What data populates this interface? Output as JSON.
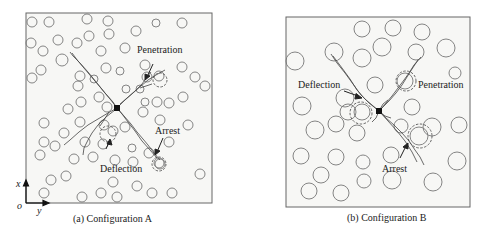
{
  "panels": [
    {
      "id": "a",
      "caption": "(a) Configuration A",
      "frame": {
        "x": 26,
        "y": 13,
        "w": 186,
        "h": 190
      },
      "annotations": {
        "penetration": "Penetration",
        "deflection": "Deflection",
        "arrest": "Arrest"
      },
      "axes": {
        "origin": "o",
        "x": "x",
        "y": "y"
      },
      "circles": [
        [
          32,
          22,
          5
        ],
        [
          49,
          22,
          5
        ],
        [
          87,
          19,
          5
        ],
        [
          108,
          21,
          5
        ],
        [
          156,
          23,
          4
        ],
        [
          182,
          23,
          5
        ],
        [
          31,
          43,
          5
        ],
        [
          43,
          51,
          5
        ],
        [
          58,
          40,
          5
        ],
        [
          77,
          43,
          5
        ],
        [
          89,
          36,
          5
        ],
        [
          109,
          34,
          5
        ],
        [
          136,
          31,
          5
        ],
        [
          125,
          48,
          5
        ],
        [
          101,
          51,
          5
        ],
        [
          62,
          60,
          6
        ],
        [
          41,
          70,
          5
        ],
        [
          32,
          78,
          5
        ],
        [
          106,
          68,
          5
        ],
        [
          80,
          76,
          5
        ],
        [
          145,
          65,
          5
        ],
        [
          159,
          76,
          5
        ],
        [
          182,
          67,
          5
        ],
        [
          195,
          77,
          5
        ],
        [
          205,
          86,
          5
        ],
        [
          120,
          71,
          4
        ],
        [
          140,
          89,
          4
        ],
        [
          157,
          102,
          5
        ],
        [
          147,
          77,
          5
        ],
        [
          94,
          79,
          4
        ],
        [
          126,
          89,
          4
        ],
        [
          99,
          97,
          5
        ],
        [
          78,
          86,
          5
        ],
        [
          68,
          109,
          5
        ],
        [
          81,
          102,
          5
        ],
        [
          107,
          107,
          5
        ],
        [
          145,
          102,
          4
        ],
        [
          143,
          112,
          5
        ],
        [
          169,
          103,
          5
        ],
        [
          183,
          97,
          5
        ],
        [
          160,
          120,
          5
        ],
        [
          188,
          125,
          5
        ],
        [
          44,
          123,
          5
        ],
        [
          80,
          122,
          5
        ],
        [
          104,
          125,
          5
        ],
        [
          125,
          127,
          5
        ],
        [
          64,
          133,
          5
        ],
        [
          44,
          142,
          5
        ],
        [
          55,
          146,
          5
        ],
        [
          85,
          142,
          5
        ],
        [
          103,
          144,
          5
        ],
        [
          113,
          131,
          5
        ],
        [
          132,
          148,
          4
        ],
        [
          149,
          153,
          5
        ],
        [
          169,
          142,
          5
        ],
        [
          40,
          155,
          5
        ],
        [
          74,
          159,
          5
        ],
        [
          93,
          157,
          5
        ],
        [
          115,
          160,
          5
        ],
        [
          133,
          162,
          5
        ],
        [
          160,
          164,
          5
        ],
        [
          159,
          163,
          5
        ],
        [
          51,
          180,
          5
        ],
        [
          66,
          176,
          5
        ],
        [
          113,
          182,
          5
        ],
        [
          137,
          186,
          5
        ],
        [
          200,
          174,
          5
        ],
        [
          44,
          193,
          5
        ],
        [
          82,
          197,
          5
        ],
        [
          101,
          193,
          5
        ],
        [
          117,
          197,
          5
        ],
        [
          152,
          193,
          5
        ],
        [
          172,
          193,
          5
        ]
      ],
      "dashed_circles": [
        [
          160,
          80,
          7
        ],
        [
          108,
          134,
          8
        ],
        [
          159,
          164,
          7
        ]
      ],
      "tip": [
        117,
        108
      ]
    },
    {
      "id": "b",
      "caption": "(b) Configuration B",
      "frame": {
        "x": 286,
        "y": 17,
        "w": 184,
        "h": 190
      },
      "annotations": {
        "penetration": "Penetration",
        "deflection": "Deflection",
        "arrest": "Arrest"
      },
      "circles": [
        [
          362,
          29,
          8
        ],
        [
          393,
          28,
          8
        ],
        [
          422,
          32,
          8
        ],
        [
          295,
          61,
          9
        ],
        [
          334,
          52,
          9
        ],
        [
          362,
          58,
          9
        ],
        [
          382,
          47,
          9
        ],
        [
          416,
          52,
          8
        ],
        [
          446,
          48,
          9
        ],
        [
          455,
          73,
          6
        ],
        [
          375,
          85,
          8
        ],
        [
          345,
          98,
          9
        ],
        [
          302,
          106,
          9
        ],
        [
          412,
          107,
          8
        ],
        [
          348,
          112,
          8
        ],
        [
          315,
          130,
          9
        ],
        [
          336,
          124,
          8
        ],
        [
          357,
          133,
          8
        ],
        [
          401,
          126,
          7
        ],
        [
          432,
          127,
          9
        ],
        [
          459,
          125,
          8
        ],
        [
          301,
          156,
          8
        ],
        [
          336,
          157,
          8
        ],
        [
          363,
          162,
          7
        ],
        [
          391,
          155,
          8
        ],
        [
          457,
          161,
          9
        ],
        [
          321,
          175,
          8
        ],
        [
          364,
          181,
          7
        ],
        [
          392,
          180,
          9
        ],
        [
          433,
          182,
          9
        ],
        [
          309,
          191,
          8
        ],
        [
          341,
          193,
          8
        ]
      ],
      "solid_inner": [
        [
          405,
          81,
          8
        ],
        [
          362,
          112,
          8
        ],
        [
          419,
          136,
          9
        ]
      ],
      "dashed_circles": [
        [
          406,
          81,
          10
        ],
        [
          361,
          113,
          11
        ],
        [
          420,
          136,
          12
        ]
      ],
      "tip": [
        379,
        111
      ]
    }
  ]
}
